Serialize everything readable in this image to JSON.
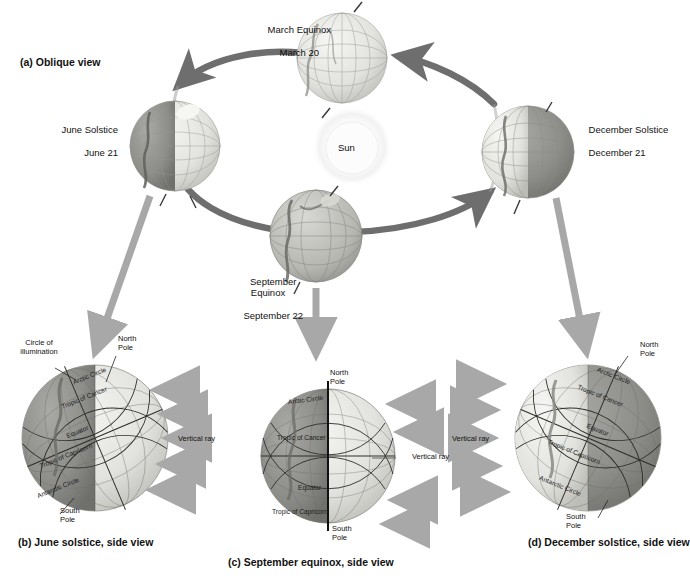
{
  "figure": {
    "panel_a_label": "(a) Oblique view",
    "panel_b_label": "(b) June solstice, side view",
    "panel_c_label": "(c) September equinox, side view",
    "panel_d_label": "(d) December solstice, side view"
  },
  "orbit": {
    "sun_label": "Sun",
    "positions": [
      {
        "name": "march-equinox",
        "title": "March Equinox",
        "date": "March 20"
      },
      {
        "name": "june-solstice",
        "title": "June Solstice",
        "date": "June 21"
      },
      {
        "name": "september-equinox",
        "title": "September\nEquinox",
        "date": "September 22"
      },
      {
        "name": "december-solstice",
        "title": "December Solstice",
        "date": "December 21"
      }
    ]
  },
  "side_views": {
    "june": {
      "circle_of_illumination": "Circle of\nillumination",
      "north_pole": "North\nPole",
      "south_pole": "South\nPole",
      "vertical_ray": "Vertical ray",
      "arctic_circle": "Arctic Circle",
      "tropic_of_cancer": "Tropic of Cancer",
      "equator": "Equator",
      "tropic_of_capricorn": "Tropic of Capricorn",
      "antarctic_circle": "Antarctic Circle"
    },
    "september": {
      "north_pole": "North\nPole",
      "south_pole": "South\nPole",
      "vertical_ray": "Vertical ray",
      "arctic_circle": "Arctic Circle",
      "tropic_of_cancer": "Tropic of Cancer",
      "equator": "Equator",
      "tropic_of_capricorn": "Tropic of Capricorn"
    },
    "december": {
      "north_pole": "North\nPole",
      "south_pole": "South\nPole",
      "vertical_ray": "Vertical ray",
      "arctic_circle": "Arctic Circle",
      "tropic_of_cancer": "Tropic of Cancer",
      "equator": "Equator",
      "tropic_of_capricorn": "Tropic of Capricorn",
      "antarctic_circle": "Antarctic Circle"
    }
  },
  "colors": {
    "lit": "#e8e8e6",
    "dark": "#8f8f8f",
    "orbit_arrow": "#6e6e6e",
    "ray_arrow": "#c6c6c6",
    "link_arrow": "#a8a8a8",
    "sun": "#fbfbfb"
  }
}
